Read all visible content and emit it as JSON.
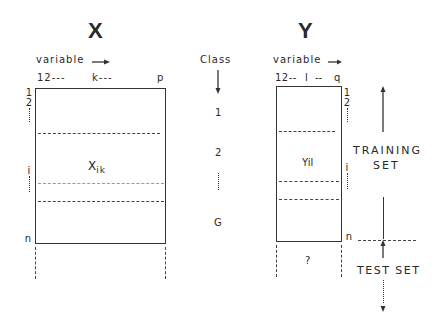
{
  "matrix_x": {
    "title": "X",
    "column_axis_label": "variable",
    "column_ticks": [
      "12---",
      "k---",
      "p"
    ],
    "row_ticks": [
      "1",
      "2",
      "i",
      "n"
    ],
    "element_label": "X",
    "element_subscript": "ik"
  },
  "class_column": {
    "label": "Class",
    "items": [
      "1",
      "2",
      "G"
    ]
  },
  "matrix_y": {
    "title": "Y",
    "column_axis_label": "variable",
    "column_ticks": [
      "12--",
      "l",
      "--",
      "q"
    ],
    "row_ticks": [
      "1",
      "2",
      "i",
      "n"
    ],
    "element_label": "Yil",
    "unknown_label": "?"
  },
  "sets": {
    "training_line1": "TRAINING",
    "training_line2": "SET",
    "test": "TEST SET"
  }
}
